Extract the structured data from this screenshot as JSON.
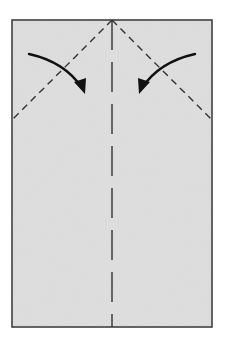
{
  "diagram": {
    "type": "origami-fold-step",
    "paper": {
      "x": 12,
      "y": 20,
      "width": 200,
      "height": 307,
      "fill": "#dcdcdc",
      "stroke": "#333333"
    },
    "valley_folds": [
      {
        "name": "left-diagonal-fold",
        "x1": 112,
        "y1": 20,
        "x2": 12,
        "y2": 120
      },
      {
        "name": "right-diagonal-fold",
        "x1": 112,
        "y1": 20,
        "x2": 212,
        "y2": 120
      },
      {
        "name": "center-crease",
        "x1": 112,
        "y1": 20,
        "x2": 112,
        "y2": 327
      }
    ],
    "arrows": [
      {
        "name": "left-fold-arrow",
        "direction": "down-right"
      },
      {
        "name": "right-fold-arrow",
        "direction": "down-left"
      }
    ],
    "colors": {
      "paper": "#dcdcdc",
      "line": "#333333",
      "arrow": "#111111",
      "background": "#ffffff"
    }
  }
}
